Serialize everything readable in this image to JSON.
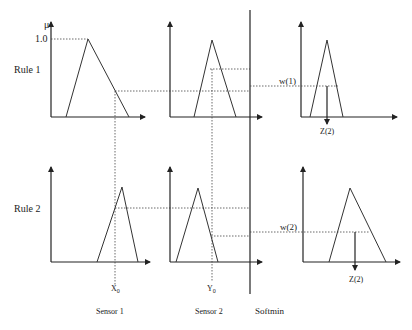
{
  "labels": {
    "mu": "μ",
    "one": "1.0",
    "rule1": "Rule 1",
    "rule2": "Rule 2",
    "w1": "w(1)",
    "w2": "w(2)",
    "z_top": "Z(2)",
    "z_bottom": "Z(2)",
    "x0": "X",
    "x0_sub": "0",
    "y0": "Y",
    "y0_sub": "0",
    "sensor1": "Sensor 1",
    "sensor2": "Sensor 2",
    "softmin": "Softmin"
  },
  "colors": {
    "line": "#222222",
    "background": "#ffffff"
  }
}
